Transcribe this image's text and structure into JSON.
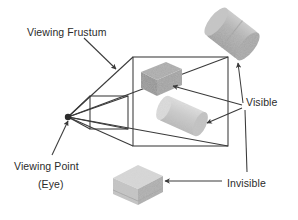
{
  "figure": {
    "title": "Viewing Frustum",
    "background_color": "#ffffff",
    "line_color": "#3a3a3a",
    "text_color": "#2b2b2b"
  },
  "labels": {
    "frustum": "Viewing Frustum",
    "viewing_point": "Viewing Point",
    "eye": "(Eye)",
    "visible": "Visible",
    "invisible": "Invisible"
  },
  "objects": [
    {
      "name": "cylinder-outside-top-right",
      "shape": "cylinder",
      "state": "visible",
      "fill": "#b4b4b4",
      "position": "top-right, outside frustum"
    },
    {
      "name": "box-inside-frustum",
      "shape": "box",
      "state": "visible",
      "fill": "#9a9a9a",
      "position": "upper-left inside frustum"
    },
    {
      "name": "cylinder-inside-frustum",
      "shape": "cylinder",
      "state": "visible",
      "fill": "#c8c8c8",
      "position": "lower-right inside frustum"
    },
    {
      "name": "cube-outside-bottom",
      "shape": "cube",
      "state": "invisible",
      "fill": "#d2d2d2",
      "position": "bottom-center, outside frustum"
    }
  ],
  "geometry": {
    "eye_point": {
      "x": 68,
      "y": 117
    },
    "near_plane": {
      "left": 90,
      "top": 96,
      "right": 128,
      "bottom": 129
    },
    "far_plane": {
      "left": 133,
      "top": 57,
      "right": 228,
      "bottom": 146
    }
  },
  "arrows": [
    {
      "name": "arrow-frustum",
      "from": {
        "x": 84,
        "y": 38
      },
      "to": {
        "x": 116,
        "y": 69
      }
    },
    {
      "name": "arrow-viewpoint",
      "from": {
        "x": 52,
        "y": 155
      },
      "to": {
        "x": 68,
        "y": 120
      }
    },
    {
      "name": "arrow-visible-cylinder-outside",
      "from": {
        "x": 244,
        "y": 104
      },
      "to": {
        "x": 238,
        "y": 62
      }
    },
    {
      "name": "arrow-visible-box-inside",
      "from": {
        "x": 243,
        "y": 106
      },
      "to": {
        "x": 172,
        "y": 85
      }
    },
    {
      "name": "arrow-visible-cylinder-inside",
      "from": {
        "x": 243,
        "y": 110
      },
      "to": {
        "x": 205,
        "y": 122
      }
    },
    {
      "name": "arrow-invisible",
      "from": {
        "x": 222,
        "y": 181
      },
      "to": {
        "x": 163,
        "y": 181
      }
    },
    {
      "name": "leader-invisible-to-frustum",
      "from": {
        "x": 245,
        "y": 108
      },
      "to": {
        "x": 246,
        "y": 170
      }
    }
  ]
}
